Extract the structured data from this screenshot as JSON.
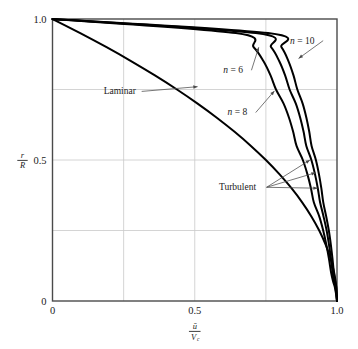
{
  "chart_data": {
    "type": "line",
    "title": "",
    "xlabel": "ū/Vс",
    "xlabel_numerator": "ū",
    "xlabel_denominator": "V",
    "xlabel_denominator_sub": "c",
    "ylabel_numerator": "r",
    "ylabel_denominator": "R",
    "xlim": [
      0,
      1
    ],
    "ylim": [
      0,
      1
    ],
    "xticks": [
      "0",
      "0.5",
      "1.0"
    ],
    "xtick_values": [
      0,
      0.5,
      1.0
    ],
    "yticks": [
      "0",
      "0.5",
      "1.0"
    ],
    "ytick_values": [
      0,
      0.5,
      1.0
    ],
    "grid": true,
    "grid_x": [
      0.25,
      0.5,
      0.75
    ],
    "grid_y": [
      0.25,
      0.5,
      0.75
    ],
    "legend_position": "inline-annotations",
    "series": [
      {
        "name": "Laminar",
        "label": "Laminar",
        "equation": "u/Vc = 1 - (r/R)^2",
        "x": [
          0.0,
          0.0975,
          0.19,
          0.2775,
          0.36,
          0.4375,
          0.51,
          0.5775,
          0.64,
          0.6975,
          0.75,
          0.7975,
          0.84,
          0.8775,
          0.91,
          0.9375,
          0.96,
          0.9775,
          0.99,
          0.9975,
          1.0
        ],
        "y": [
          1.0,
          0.95,
          0.9,
          0.85,
          0.8,
          0.75,
          0.7,
          0.65,
          0.6,
          0.55,
          0.5,
          0.45,
          0.4,
          0.35,
          0.3,
          0.25,
          0.2,
          0.15,
          0.1,
          0.05,
          0.0
        ]
      },
      {
        "name": "n = 6",
        "label": "n = 6",
        "equation": "u/Vc = (1 - r/R)^(1/6)",
        "x": [
          0.0,
          0.6444,
          0.7071,
          0.7418,
          0.7664,
          0.7856,
          0.8123,
          0.8313,
          0.8459,
          0.8578,
          0.8799,
          0.8959,
          0.9084,
          0.9185,
          0.9376,
          0.9515,
          0.9625,
          0.9716,
          0.9794,
          0.9861,
          0.9921,
          0.9975,
          1.0
        ],
        "y": [
          1.0,
          0.95,
          0.9,
          0.85,
          0.8,
          0.75,
          0.7,
          0.65,
          0.6,
          0.55,
          0.5,
          0.45,
          0.4,
          0.35,
          0.3,
          0.25,
          0.2,
          0.15,
          0.1,
          0.07,
          0.05,
          0.02,
          0.0
        ]
      },
      {
        "name": "n = 8",
        "label": "n = 8",
        "equation": "u/Vc = (1 - r/R)^(1/8)",
        "x": [
          0.0,
          0.7148,
          0.7683,
          0.7972,
          0.8176,
          0.8334,
          0.8553,
          0.8707,
          0.8826,
          0.8922,
          0.9099,
          0.9226,
          0.9325,
          0.9405,
          0.9526,
          0.9636,
          0.9718,
          0.9787,
          0.9846,
          0.9896,
          0.9941,
          0.9981,
          1.0
        ],
        "y": [
          1.0,
          0.95,
          0.9,
          0.85,
          0.8,
          0.75,
          0.7,
          0.65,
          0.6,
          0.55,
          0.5,
          0.45,
          0.4,
          0.35,
          0.3,
          0.25,
          0.2,
          0.15,
          0.1,
          0.07,
          0.05,
          0.02,
          0.0
        ]
      },
      {
        "name": "n = 10",
        "label": "n = 10",
        "equation": "u/Vc = (1 - r/R)^(1/10)",
        "x": [
          0.0,
          0.7579,
          0.8046,
          0.8296,
          0.8471,
          0.8606,
          0.8793,
          0.8924,
          0.9025,
          0.9107,
          0.9258,
          0.9365,
          0.9449,
          0.9517,
          0.962,
          0.9713,
          0.9783,
          0.9841,
          0.9891,
          0.9933,
          0.9971,
          0.999,
          1.0
        ],
        "y": [
          1.0,
          0.95,
          0.9,
          0.85,
          0.8,
          0.75,
          0.7,
          0.65,
          0.6,
          0.55,
          0.5,
          0.45,
          0.4,
          0.35,
          0.3,
          0.25,
          0.2,
          0.15,
          0.1,
          0.07,
          0.05,
          0.02,
          0.0
        ]
      }
    ],
    "annotations": [
      {
        "name": "laminar-annotation",
        "text": "Laminar",
        "text_x": 0.18,
        "text_y": 0.745,
        "point_x": 0.51,
        "point_y": 0.76
      },
      {
        "name": "n6-annotation",
        "text": "n = 6",
        "text_x": 0.6,
        "text_y": 0.82,
        "point_x": 0.725,
        "point_y": 0.9
      },
      {
        "name": "n8-annotation",
        "text": "n = 8",
        "text_x": 0.615,
        "text_y": 0.67,
        "point_x": 0.78,
        "point_y": 0.745
      },
      {
        "name": "n10-annotation",
        "text": "n = 10",
        "text_x": 0.835,
        "text_y": 0.925,
        "point_x": 0.865,
        "point_y": 0.86
      },
      {
        "name": "turbulent-annotation",
        "text": "Turbulent",
        "text_x": 0.585,
        "text_y": 0.405,
        "targets": [
          {
            "x": 0.905,
            "y": 0.5
          },
          {
            "x": 0.925,
            "y": 0.455
          },
          {
            "x": 0.932,
            "y": 0.4
          }
        ]
      }
    ],
    "colors": {
      "curve": "#000000",
      "axis": "#4a4a4a",
      "grid": "#c9c9c9",
      "text": "#1a1a1a",
      "background": "#ffffff",
      "leader": "#4a4a4a"
    }
  }
}
